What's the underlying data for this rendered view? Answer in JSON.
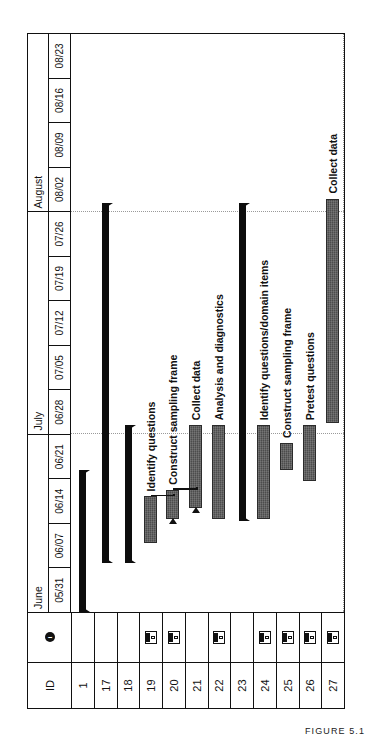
{
  "figure": {
    "caption": "FIGURE 5.1"
  },
  "table": {
    "header": {
      "id_label": "ID",
      "indicator_label": "i",
      "indicator_icon": "info-icon"
    },
    "rows": [
      {
        "id": "1",
        "has_note": false,
        "note_icon": "notes-icon"
      },
      {
        "id": "17",
        "has_note": false,
        "note_icon": "notes-icon"
      },
      {
        "id": "18",
        "has_note": false,
        "note_icon": "notes-icon"
      },
      {
        "id": "19",
        "has_note": true,
        "note_icon": "notes-icon"
      },
      {
        "id": "20",
        "has_note": true,
        "note_icon": "notes-icon"
      },
      {
        "id": "21",
        "has_note": false,
        "note_icon": "notes-icon"
      },
      {
        "id": "22",
        "has_note": true,
        "note_icon": "notes-icon"
      },
      {
        "id": "23",
        "has_note": false,
        "note_icon": "notes-icon"
      },
      {
        "id": "24",
        "has_note": true,
        "note_icon": "notes-icon"
      },
      {
        "id": "25",
        "has_note": true,
        "note_icon": "notes-icon"
      },
      {
        "id": "26",
        "has_note": true,
        "note_icon": "notes-icon"
      },
      {
        "id": "27",
        "has_note": true,
        "note_icon": "notes-icon"
      }
    ]
  },
  "timeline": {
    "months": [
      {
        "label": "June",
        "weeks": 4
      },
      {
        "label": "July",
        "weeks": 5
      },
      {
        "label": "August",
        "weeks": 4
      }
    ],
    "weeks": [
      "05/31",
      "06/07",
      "06/14",
      "06/21",
      "06/28",
      "07/05",
      "07/12",
      "07/19",
      "07/26",
      "08/02",
      "08/09",
      "08/16",
      "08/23"
    ],
    "major_gridlines_after_week": [
      4,
      9
    ]
  },
  "chart_data": {
    "type": "bar",
    "xlabel": "",
    "ylabel": "",
    "x_axis_type": "week-start dates",
    "x_tick_labels": [
      "05/31",
      "06/07",
      "06/14",
      "06/21",
      "06/28",
      "07/05",
      "07/12",
      "07/19",
      "07/26",
      "08/02",
      "08/09",
      "08/16",
      "08/23"
    ],
    "grid": true,
    "legend": "none",
    "tasks": [
      {
        "id": "1",
        "label": "",
        "kind": "summary",
        "start_week": 0,
        "end_week": 3.2
      },
      {
        "id": "17",
        "label": "",
        "kind": "summary",
        "start_week": 1.1,
        "end_week": 9.2
      },
      {
        "id": "18",
        "label": "",
        "kind": "summary",
        "start_week": 1.1,
        "end_week": 4.2
      },
      {
        "id": "19",
        "label": "Identify questions",
        "kind": "task",
        "start_week": 1.55,
        "end_week": 2.6
      },
      {
        "id": "20",
        "label": "Construct sampling frame",
        "kind": "task",
        "start_week": 2.1,
        "end_week": 2.75
      },
      {
        "id": "21",
        "label": "Collect data",
        "kind": "task",
        "start_week": 2.35,
        "end_week": 4.2
      },
      {
        "id": "22",
        "label": "Analysis and diagnostics",
        "kind": "task",
        "start_week": 2.1,
        "end_week": 4.2
      },
      {
        "id": "23",
        "label": "",
        "kind": "summary",
        "start_week": 2.05,
        "end_week": 9.2
      },
      {
        "id": "24",
        "label": "Identify questions/domain items",
        "kind": "task",
        "start_week": 2.1,
        "end_week": 4.2
      },
      {
        "id": "25",
        "label": "Construct sampling frame",
        "kind": "task",
        "start_week": 3.2,
        "end_week": 3.8
      },
      {
        "id": "26",
        "label": "Pretest questions",
        "kind": "task",
        "start_week": 2.95,
        "end_week": 4.2
      },
      {
        "id": "27",
        "label": "Collect data",
        "kind": "task",
        "start_week": 4.25,
        "end_week": 9.3
      }
    ],
    "links": [
      {
        "from": "19",
        "to": "20"
      },
      {
        "from": "20",
        "to": "21"
      }
    ]
  }
}
